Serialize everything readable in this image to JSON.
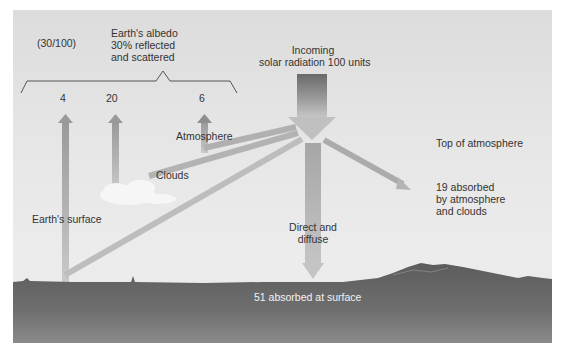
{
  "diagram": {
    "incoming": {
      "line1": "Incoming",
      "line2": "solar radiation 100 units",
      "value": 100
    },
    "albedo": {
      "fraction": "(30/100)",
      "line1": "Earth's albedo",
      "line2": "30% reflected",
      "line3": "and scattered",
      "percent": 30
    },
    "reflected": [
      {
        "label": "4",
        "source": "Earth's surface",
        "value": 4
      },
      {
        "label": "20",
        "source": "Clouds",
        "value": 20
      },
      {
        "label": "6",
        "source": "Atmosphere",
        "value": 6
      }
    ],
    "labels": {
      "atmosphere": "Atmosphere",
      "clouds": "Clouds",
      "earth_surface": "Earth's surface",
      "top_of_atmosphere": "Top of atmosphere",
      "direct_line1": "Direct and",
      "direct_line2": "diffuse",
      "absorbed_atm_line1": "19 absorbed",
      "absorbed_atm_line2": "by atmosphere",
      "absorbed_atm_line3": "and clouds",
      "absorbed_surface": "51 absorbed at surface"
    },
    "absorbed": {
      "atmosphere_clouds": 19,
      "surface": 51
    },
    "colors": {
      "sky": "#e4e4e4",
      "ground": "#6a6a6a",
      "arrow": "#a9a9a9",
      "incoming_arrow_top": "#6e6e6e",
      "cloud": "#f7f7f7",
      "text": "#333333"
    }
  }
}
